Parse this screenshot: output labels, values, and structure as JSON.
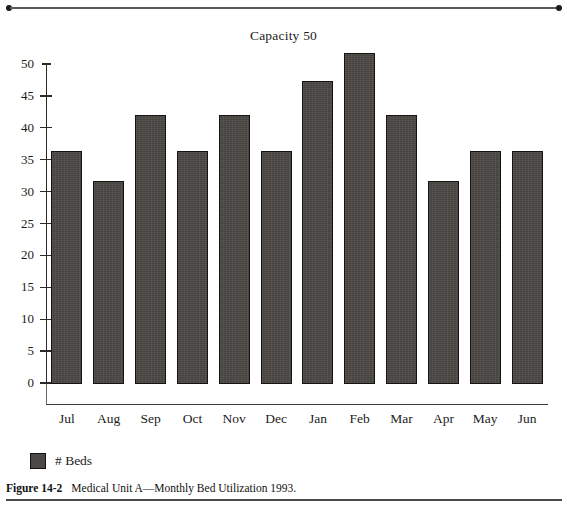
{
  "chart_data": {
    "type": "bar",
    "title": "Capacity 50",
    "xlabel": "",
    "ylabel": "",
    "categories": [
      "Jul",
      "Aug",
      "Sep",
      "Oct",
      "Nov",
      "Dec",
      "Jan",
      "Feb",
      "Mar",
      "Apr",
      "May",
      "Jun"
    ],
    "series": [
      {
        "name": "# Beds",
        "color": "#4b4845",
        "values": [
          36.3,
          31.6,
          42.0,
          36.3,
          42.0,
          36.3,
          47.3,
          51.7,
          42.0,
          31.6,
          36.3,
          36.3
        ]
      }
    ],
    "ylim": [
      0,
      50
    ],
    "yticks": [
      0,
      5,
      10,
      15,
      20,
      25,
      30,
      35,
      40,
      45,
      50
    ],
    "ytick_labels": [
      "0",
      "5",
      "10",
      "15",
      "20",
      "25",
      "30",
      "35",
      "40",
      "45",
      "50"
    ],
    "grid": false,
    "legend_position": "below-left",
    "legend_entries": [
      "# Beds"
    ]
  },
  "legend": {
    "label": "# Beds",
    "swatch_color": "#4b4845"
  },
  "caption": {
    "figure_number": "Figure 14-2",
    "text": "Medical Unit A—Monthly Bed Utilization 1993."
  }
}
